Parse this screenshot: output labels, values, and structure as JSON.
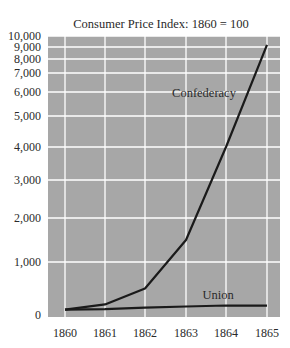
{
  "chart_data": {
    "type": "line",
    "title": "Consumer Price Index: 1860 = 100",
    "xlabel": "",
    "ylabel": "",
    "x": [
      1860,
      1861,
      1862,
      1863,
      1864,
      1865
    ],
    "categories": [
      "1860",
      "1861",
      "1862",
      "1863",
      "1864",
      "1865"
    ],
    "series": [
      {
        "name": "Confederacy",
        "values": [
          100,
          200,
          500,
          1500,
          4000,
          9200
        ],
        "color": "#1a1a1a"
      },
      {
        "name": "Union",
        "values": [
          100,
          110,
          140,
          160,
          180,
          175
        ],
        "color": "#1a1a1a"
      }
    ],
    "y_ticks": [
      0,
      1000,
      2000,
      3000,
      4000,
      5000,
      6000,
      7000,
      8000,
      9000,
      10000
    ],
    "y_tick_labels": [
      "0",
      "1,000",
      "2,000",
      "3,000",
      "4,000",
      "5,000",
      "6,000",
      "7,000",
      "8,000",
      "9,000",
      "10,000"
    ],
    "y_scale": "compressed (non-linear, tick spacing decreases with value)",
    "ylim": [
      0,
      10000
    ],
    "grid": true,
    "legend": "inline labels near lines",
    "background_color": "#a7a7a7",
    "grid_color": "#ffffff"
  },
  "layout": {
    "plot": {
      "left": 48,
      "right": 280,
      "top": 36,
      "bottom": 317
    },
    "x_pixels": [
      65,
      105,
      145,
      186,
      226,
      267
    ],
    "y_tick_pixels": [
      315,
      262,
      218,
      180,
      147,
      116,
      92,
      73,
      59,
      47,
      36
    ],
    "series_label_positions": [
      {
        "x": 204,
        "y": 97
      },
      {
        "x": 218,
        "y": 299
      }
    ],
    "title_pos": {
      "x": 161,
      "y": 28
    },
    "x_label_y": 337,
    "y_label_x": 41
  }
}
